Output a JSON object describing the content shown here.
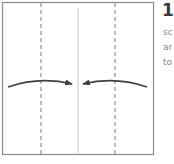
{
  "step": {
    "number": "1",
    "text_lines": [
      "sc",
      "ar",
      "to"
    ]
  },
  "diagram": {
    "paper_square": {
      "x": 2,
      "y": 2,
      "width": 152,
      "height": 153,
      "stroke": "#8a8a8a"
    },
    "valley_fold_lines": [
      {
        "x": 41
      },
      {
        "x": 115
      }
    ],
    "center_crease": {
      "x": 78,
      "y1": 8,
      "y2": 153,
      "stroke": "#c8c8c8"
    },
    "arrows": [
      {
        "direction": "right",
        "from_x": 8,
        "to_x": 72,
        "y": 84
      },
      {
        "direction": "left",
        "from_x": 147,
        "to_x": 83,
        "y": 84
      }
    ],
    "colors": {
      "arrow": "#404040",
      "dash": "#7a7a7a"
    }
  }
}
